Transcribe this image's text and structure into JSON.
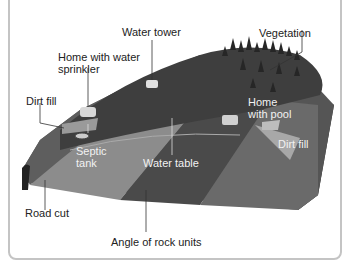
{
  "diagram": {
    "labels": {
      "water_tower": "Water tower",
      "vegetation": "Vegetation",
      "home_sprinkler_line1": "Home with water",
      "home_sprinkler_line2": "sprinkler",
      "dirt_fill_left": "Dirt fill",
      "home_pool_line1": "Home",
      "home_pool_line2": "with pool",
      "dirt_fill_right": "Dirt fill",
      "septic_line1": "Septic",
      "septic_line2": "tank",
      "water_table": "Water table",
      "road_cut": "Road cut",
      "angle_rock_units": "Angle of rock units"
    },
    "colors": {
      "frame": "#c4c4c4",
      "rock_dark": "#3a3a3a",
      "rock_mid": "#5a5a5a",
      "rock_light": "#8a8a8a",
      "hill": "#4a4a4a",
      "trees": "#2a2a2a"
    }
  }
}
